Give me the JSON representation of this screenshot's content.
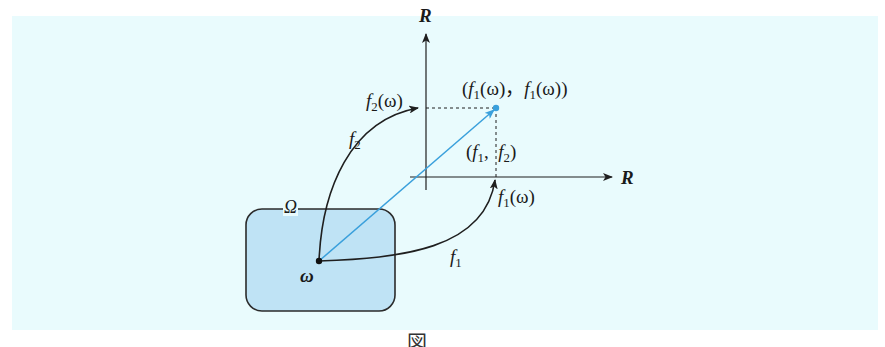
{
  "diagram": {
    "axes": {
      "vertical_label": "R",
      "horizontal_label": "R"
    },
    "domain_set": {
      "label": "Ω",
      "point_label": "ω",
      "fill_color": "#bfe3f5",
      "border_color": "#2b2b2b"
    },
    "maps": {
      "f1_label": "f",
      "f1_sub": "1",
      "f2_label": "f",
      "f2_sub": "2"
    },
    "values": {
      "f1_omega": {
        "f": "f",
        "sub": "1",
        "arg": "(ω)"
      },
      "f2_omega": {
        "f": "f",
        "sub": "2",
        "arg": "(ω)"
      }
    },
    "point": {
      "open": "(",
      "f_a": "f",
      "sub_a": "1",
      "arg_a": "(ω)",
      "sep": "，",
      "f_b": "f",
      "sub_b": "1",
      "arg_b": "(ω))"
    },
    "pair_map": {
      "open": "(",
      "f_a": "f",
      "sub_a": "1",
      "sep": ",",
      "f_b": "f",
      "sub_b": "2",
      "close": ")"
    },
    "colors": {
      "panel_bg": "#e9fbfd",
      "accent_blue": "#3aa0dc",
      "line_dark": "#1f1f1f"
    },
    "caption": "図"
  }
}
